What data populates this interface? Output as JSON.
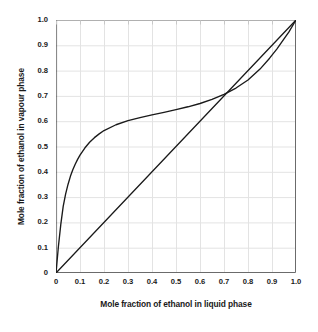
{
  "chart_data": {
    "type": "line",
    "title": "",
    "xlabel": "Mole fraction of ethanol in liquid phase",
    "ylabel": "Mole fraction of ethanol in vapour phase",
    "xlim": [
      0,
      1.0
    ],
    "ylim": [
      0,
      1.0
    ],
    "grid": true,
    "legend": "none",
    "xticks": [
      "0",
      "0.1",
      "0.2",
      "0.3",
      "0.4",
      "0.5",
      "0.6",
      "0.7",
      "0.8",
      "0.9",
      "1.0"
    ],
    "xtick_values": [
      0,
      0.1,
      0.2,
      0.3,
      0.4,
      0.5,
      0.6,
      0.7,
      0.8,
      0.9,
      1.0
    ],
    "yticks": [
      "0",
      "0.1",
      "0.2",
      "0.3",
      "0.4",
      "0.5",
      "0.6",
      "0.7",
      "0.8",
      "0.9",
      "1.0"
    ],
    "ytick_values": [
      0,
      0.1,
      0.2,
      0.3,
      0.4,
      0.5,
      0.6,
      0.7,
      0.8,
      0.9,
      1.0
    ],
    "line_color": "#1a1a1a",
    "grid_color": "#e3e3e3",
    "axis_color": "#6b6b6b",
    "background_color": "#ffffff",
    "series": [
      {
        "name": "equilibrium curve",
        "x": [
          0.0,
          0.01,
          0.02,
          0.03,
          0.04,
          0.05,
          0.06,
          0.07,
          0.08,
          0.09,
          0.1,
          0.12,
          0.14,
          0.16,
          0.18,
          0.2,
          0.25,
          0.3,
          0.35,
          0.4,
          0.45,
          0.5,
          0.55,
          0.6,
          0.65,
          0.7,
          0.75,
          0.8,
          0.85,
          0.89,
          0.92,
          0.95,
          0.97,
          1.0
        ],
        "y": [
          0.0,
          0.105,
          0.192,
          0.263,
          0.312,
          0.35,
          0.382,
          0.408,
          0.43,
          0.449,
          0.466,
          0.494,
          0.517,
          0.535,
          0.55,
          0.563,
          0.586,
          0.602,
          0.614,
          0.625,
          0.635,
          0.646,
          0.657,
          0.67,
          0.686,
          0.706,
          0.731,
          0.763,
          0.806,
          0.849,
          0.885,
          0.925,
          0.952,
          1.0
        ]
      },
      {
        "name": "y = x diagonal",
        "x": [
          0.0,
          1.0
        ],
        "y": [
          0.0,
          1.0
        ]
      }
    ]
  },
  "axis": {
    "x_title": "Mole fraction of ethanol in liquid phase",
    "y_title": "Mole fraction of ethanol in vapour phase"
  }
}
